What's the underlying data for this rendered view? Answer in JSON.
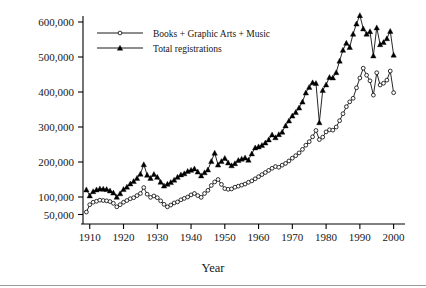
{
  "chart_data": {
    "type": "line",
    "title": "",
    "xlabel": "Year",
    "ylabel": "",
    "xlim": [
      1908,
      2001
    ],
    "ylim": [
      40000,
      625000
    ],
    "grid": false,
    "legend_position": "top-left-inside",
    "x_tick_labels": [
      "1910",
      "1920",
      "1930",
      "1940",
      "1950",
      "1960",
      "1970",
      "1980",
      "1990",
      "2000"
    ],
    "x_ticks": [
      1910,
      1920,
      1930,
      1940,
      1950,
      1960,
      1970,
      1980,
      1990,
      2000
    ],
    "y_tick_labels": [
      "50,000",
      "100,000",
      "200,000",
      "300,000",
      "400,000",
      "500,000",
      "600,000"
    ],
    "y_ticks": [
      50000,
      100000,
      200000,
      300000,
      400000,
      500000,
      600000
    ],
    "x": [
      1909,
      1910,
      1911,
      1912,
      1913,
      1914,
      1915,
      1916,
      1917,
      1918,
      1919,
      1920,
      1921,
      1922,
      1923,
      1924,
      1925,
      1926,
      1927,
      1928,
      1929,
      1930,
      1931,
      1932,
      1933,
      1934,
      1935,
      1936,
      1937,
      1938,
      1939,
      1940,
      1941,
      1942,
      1943,
      1944,
      1945,
      1946,
      1947,
      1948,
      1949,
      1950,
      1951,
      1952,
      1953,
      1954,
      1955,
      1956,
      1957,
      1958,
      1959,
      1960,
      1961,
      1962,
      1963,
      1964,
      1965,
      1966,
      1967,
      1968,
      1969,
      1970,
      1971,
      1972,
      1973,
      1974,
      1975,
      1976,
      1977,
      1978,
      1979,
      1980,
      1981,
      1982,
      1983,
      1984,
      1985,
      1986,
      1987,
      1988,
      1989,
      1990,
      1991,
      1992,
      1993,
      1994,
      1995,
      1996,
      1997,
      1998,
      1999,
      2000
    ],
    "series": [
      {
        "name": "Books + Graphic Arts + Music",
        "marker": "open-circle",
        "values": [
          57000,
          78000,
          85000,
          88000,
          91000,
          90000,
          89000,
          87000,
          82000,
          72000,
          78000,
          85000,
          90000,
          95000,
          98000,
          104000,
          110000,
          127000,
          108000,
          99000,
          103000,
          98000,
          89000,
          79000,
          72000,
          77000,
          83000,
          86000,
          92000,
          96000,
          100000,
          106000,
          110000,
          104000,
          99000,
          110000,
          119000,
          133000,
          143000,
          150000,
          136000,
          124000,
          122000,
          123000,
          128000,
          131000,
          134000,
          137000,
          142000,
          146000,
          152000,
          158000,
          164000,
          170000,
          176000,
          182000,
          187000,
          185000,
          191000,
          196000,
          203000,
          211000,
          218000,
          226000,
          236000,
          248000,
          258000,
          272000,
          290000,
          264000,
          271000,
          286000,
          292000,
          291000,
          300000,
          318000,
          338000,
          358000,
          372000,
          382000,
          412000,
          440000,
          468000,
          448000,
          432000,
          391000,
          455000,
          420000,
          425000,
          434000,
          460000,
          398000
        ]
      },
      {
        "name": "Total registrations",
        "marker": "filled-triangle",
        "values": [
          121000,
          104000,
          116000,
          121000,
          124000,
          123000,
          122000,
          118000,
          112000,
          100000,
          110000,
          122000,
          129000,
          138000,
          145000,
          154000,
          166000,
          193000,
          163000,
          154000,
          165000,
          157000,
          143000,
          132000,
          137000,
          142000,
          149000,
          157000,
          164000,
          167000,
          174000,
          177000,
          181000,
          172000,
          161000,
          170000,
          178000,
          202000,
          226000,
          192000,
          202000,
          211000,
          198000,
          190000,
          196000,
          205000,
          209000,
          212000,
          206000,
          224000,
          241000,
          244000,
          248000,
          255000,
          264000,
          278000,
          270000,
          279000,
          286000,
          304000,
          318000,
          332000,
          342000,
          355000,
          372000,
          398000,
          414000,
          427000,
          425000,
          313000,
          405000,
          421000,
          442000,
          441000,
          456000,
          489000,
          520000,
          540000,
          528000,
          566000,
          595000,
          619000,
          581000,
          566000,
          573000,
          504000,
          584000,
          536000,
          542000,
          553000,
          574000,
          506000
        ]
      }
    ]
  },
  "legend": {
    "entries": [
      {
        "label": "Books + Graphic Arts + Music",
        "marker": "open-circle-marker"
      },
      {
        "label": "Total registrations",
        "marker": "filled-triangle-marker"
      }
    ]
  },
  "axes": {
    "x_axis_title": "Year"
  },
  "colors": {
    "ink": "#000000",
    "background": "#ffffff",
    "rule": "#9a9a9a"
  }
}
